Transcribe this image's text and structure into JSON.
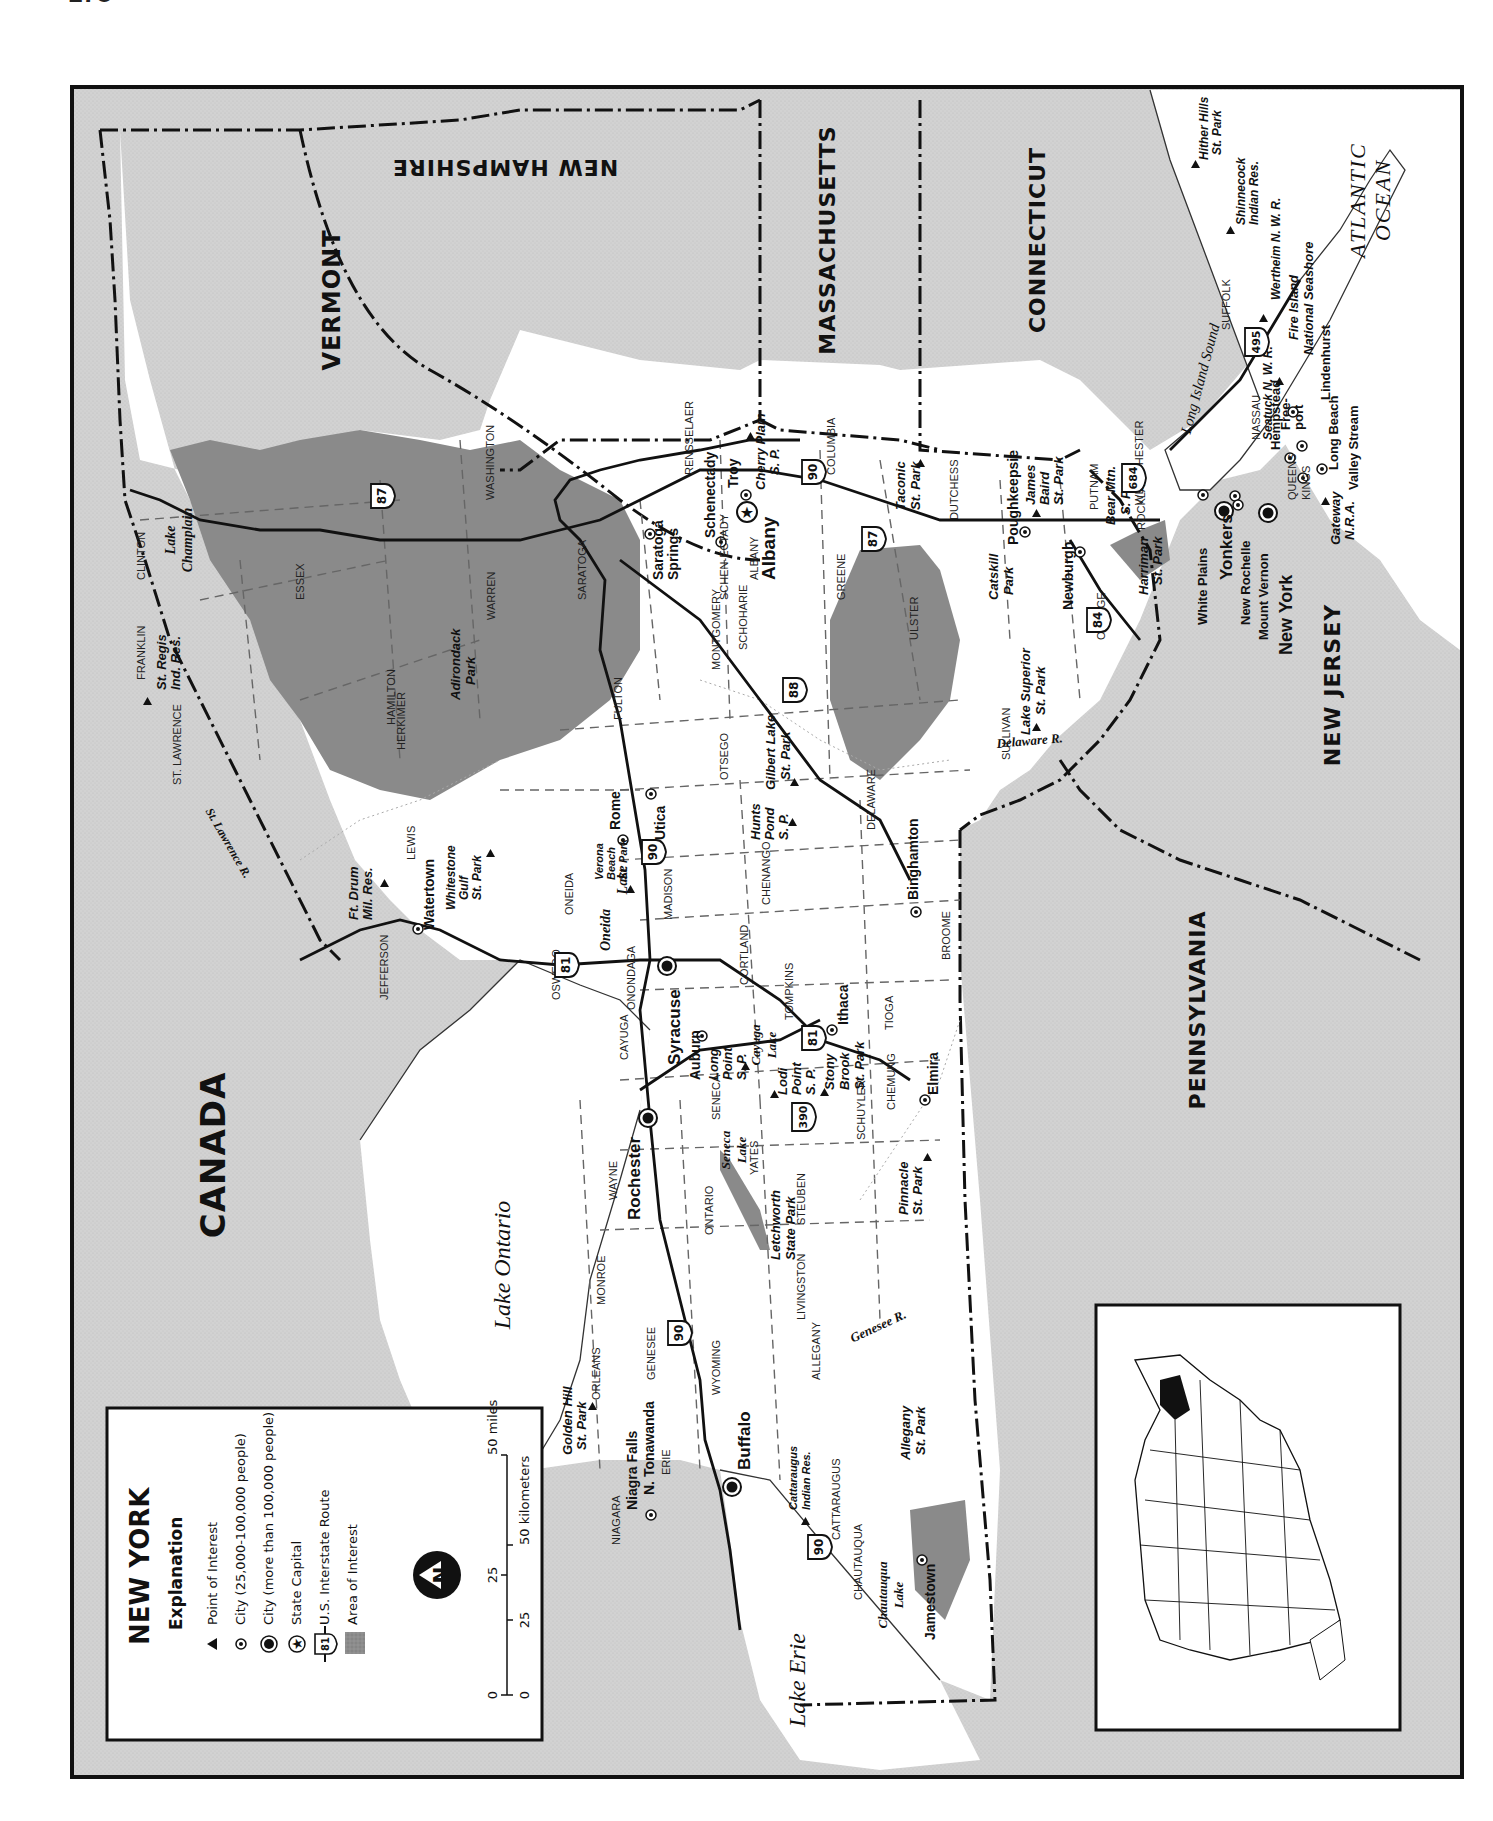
{
  "page": {
    "number": "178"
  },
  "map": {
    "title": "NEW YORK",
    "orientation": "rotated 90 degrees counter-clockwise (north to the left)",
    "colors": {
      "neighbor_land": "#cfcfcf",
      "water": "#ffffff",
      "state_fill": "#ffffff",
      "area_of_interest": "#8a8a8a",
      "border": "#111111"
    },
    "neighbors": {
      "canada": "CANADA",
      "vermont": "VERMONT",
      "new_hampshire": "NEW HAMPSHIRE",
      "massachusetts": "MASSACHUSETTS",
      "connecticut": "CONNECTICUT",
      "new_jersey": "NEW JERSEY",
      "pennsylvania": "PENNSYLVANIA"
    },
    "water": {
      "lake_ontario": "Lake Ontario",
      "lake_erie": "Lake Erie",
      "atlantic_1": "ATLANTIC",
      "atlantic_2": "OCEAN",
      "long_island_sound": "Long Island Sound",
      "lake_champlain_1": "Lake",
      "lake_champlain_2": "Champlain",
      "oneida_lake_1": "Oneida",
      "oneida_lake_2": "Lake",
      "cayuga_lake_1": "Cayuga",
      "cayuga_lake_2": "Lake",
      "seneca_lake_1": "Seneca",
      "seneca_lake_2": "Lake",
      "chautauqua_lake_1": "Chautauqua",
      "chautauqua_lake_2": "Lake",
      "st_lawrence_r": "St. Lawrence R.",
      "genesee_r": "Genesee R.",
      "delaware_r": "Delaware R."
    },
    "cities_large": {
      "buffalo": "Buffalo",
      "rochester": "Rochester",
      "syracuse": "Syracuse",
      "yonkers": "Yonkers",
      "new_york": "New York"
    },
    "capital": {
      "albany": "Albany"
    },
    "cities": {
      "niagara_falls": "Niagra Falls",
      "n_tonawanda": "N. Tonawanda",
      "jamestown": "Jamestown",
      "auburn": "Auburn",
      "ithaca": "Ithaca",
      "elmira": "Elmira",
      "binghamton": "Binghamton",
      "utica": "Utica",
      "rome": "Rome",
      "watertown": "Watertown",
      "saratoga_springs_1": "Saratoga",
      "saratoga_springs_2": "Springs",
      "schenectady": "Schenectady",
      "troy": "Troy",
      "poughkeepsie": "Poughkeepsie",
      "newburgh": "Newburgh",
      "white_plains": "White Plains",
      "new_rochelle": "New Rochelle",
      "mount_vernon": "Mount Vernon",
      "hempstead": "Hempstead",
      "freeport_1": "Free-",
      "freeport_2": "port",
      "long_beach": "Long Beach",
      "valley_stream": "Valley Stream",
      "lindenhurst": "Lindenhurst"
    },
    "points_of_interest": {
      "golden_hill_1": "Golden Hill",
      "golden_hill_2": "St. Park",
      "letchworth_1": "Letchworth",
      "letchworth_2": "State Park",
      "allegany_1": "Allegany",
      "allegany_2": "St. Park",
      "cattaraugus_1": "Cattaraugus",
      "cattaraugus_2": "Indian Res.",
      "stony_brook_1": "Stony",
      "stony_brook_2": "Brook",
      "stony_brook_3": "St. Park",
      "pinnacle_1": "Pinnacle",
      "pinnacle_2": "St. Park",
      "lodi_point_1": "Lodi",
      "lodi_point_2": "Point",
      "lodi_point_3": "S. P.",
      "long_point_1": "Long",
      "long_point_2": "Point",
      "long_point_3": "S. P.",
      "verona_beach_1": "Verona",
      "verona_beach_2": "Beach",
      "verona_beach_3": "St. Park",
      "hunts_pond_1": "Hunts",
      "hunts_pond_2": "Pond",
      "hunts_pond_3": "S. P.",
      "gilbert_lake_1": "Gilbert Lake",
      "gilbert_lake_2": "St. Park",
      "ft_drum_1": "Ft. Drum",
      "ft_drum_2": "Mil. Res.",
      "whitestone_1": "Whitestone",
      "whitestone_2": "Gulf",
      "whitestone_3": "St. Park",
      "st_regis_1": "St. Regis",
      "st_regis_2": "Ind. Res.",
      "adirondack_1": "Adirondack",
      "adirondack_2": "Park",
      "cherry_plain_1": "Cherry Plain",
      "cherry_plain_2": "S. P.",
      "taconic_1": "Taconic",
      "taconic_2": "St. Park",
      "catskill_1": "Catskill",
      "catskill_2": "Park",
      "lake_superior_1": "Lake Superior",
      "lake_superior_2": "St. Park",
      "james_baird_1": "James",
      "james_baird_2": "Baird",
      "james_baird_3": "St. Park",
      "bear_mtn_1": "Bear Mtn.",
      "bear_mtn_2": "S. P.",
      "harriman_1": "Harriman",
      "harriman_2": "St. Park",
      "gateway_1": "Gateway",
      "gateway_2": "N.R.A.",
      "seatuck": "Seatuck N. W. R.",
      "wertheim": "Wertheim N. W. R.",
      "fire_island_1": "Fire Island",
      "fire_island_2": "National Seashore",
      "shinnecock_1": "Shinnecock",
      "shinnecock_2": "Indian Res.",
      "hither_hills_1": "Hither Hills",
      "hither_hills_2": "St. Park"
    },
    "counties": [
      "NIAGARA",
      "ERIE",
      "ORLEANS",
      "GENESEE",
      "WYOMING",
      "CATTARAUGUS",
      "CHAUTAUQUA",
      "ALLEGANY",
      "MONROE",
      "LIVINGSTON",
      "STEUBEN",
      "ONTARIO",
      "WAYNE",
      "YATES",
      "SENECA",
      "SCHUYLER",
      "CHEMUNG",
      "CAYUGA",
      "TOMPKINS",
      "TIOGA",
      "ONONDAGA",
      "CORTLAND",
      "BROOME",
      "OSWEGO",
      "MADISON",
      "CHENANGO",
      "ONEIDA",
      "OTSEGO",
      "DELAWARE",
      "JEFFERSON",
      "LEWIS",
      "HERKIMER",
      "HAMILTON",
      "ST. LAWRENCE",
      "FRANKLIN",
      "CLINTON",
      "ESSEX",
      "WARREN",
      "SARATOGA",
      "FULTON",
      "MONTGOMERY",
      "SCHOHARIE",
      "SCHEN-ECTADY",
      "ALBANY",
      "GREENE",
      "ULSTER",
      "SULLIVAN",
      "WASHINGTON",
      "RENSSELAER",
      "COLUMBIA",
      "DUTCHESS",
      "ORANGE",
      "PUTNAM",
      "ROCKLAND",
      "WESTCHESTER",
      "NASSAU",
      "SUFFOLK",
      "QUEENS",
      "KINGS"
    ],
    "interstates": [
      "81",
      "90",
      "87",
      "88",
      "84",
      "684",
      "390",
      "495"
    ]
  },
  "legend": {
    "title": "NEW YORK",
    "subtitle": "Explanation",
    "items": [
      {
        "symbol": "triangle",
        "label": "Point of Interest"
      },
      {
        "symbol": "small-city-dot",
        "label": "City (25,000-100,000 people)"
      },
      {
        "symbol": "large-city-dot",
        "label": "City (more than 100,000 people)"
      },
      {
        "symbol": "capital-star",
        "label": "State Capital"
      },
      {
        "symbol": "interstate-shield",
        "shield_number": "81",
        "label": "U.S. Interstate Route"
      },
      {
        "symbol": "gray-swatch",
        "label": "Area of Interest"
      }
    ],
    "north_arrow": "N",
    "scale": {
      "miles_ticks": [
        "0",
        "25",
        "50 miles"
      ],
      "km_ticks": [
        "0",
        "25",
        "50 kilometers"
      ]
    }
  },
  "inset": {
    "description": "Locator map of the contiguous United States with New York highlighted in black"
  }
}
